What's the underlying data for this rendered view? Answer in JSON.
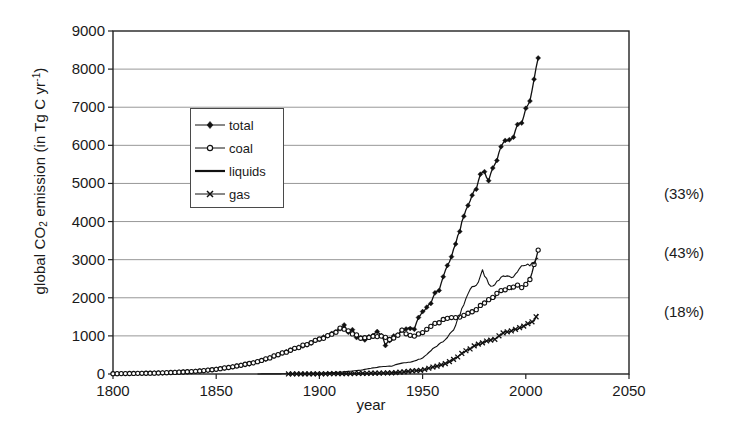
{
  "chart_data": {
    "type": "line",
    "title": "",
    "xlabel": "year",
    "ylabel": "global CO2 emission (in Tg C yr-1)",
    "ylabel_parts": {
      "pre": "global CO",
      "sub": "2",
      "mid": " emission (in Tg C yr",
      "sup": "-1",
      "post": ")"
    },
    "xlim": [
      1800,
      2050
    ],
    "ylim": [
      0,
      9000
    ],
    "xticks": [
      1800,
      1850,
      1900,
      1950,
      2000,
      2050
    ],
    "yticks": [
      0,
      1000,
      2000,
      3000,
      4000,
      5000,
      6000,
      7000,
      8000,
      9000
    ],
    "grid": "horizontal",
    "legend_position": "upper-left-inside",
    "annotations": [
      {
        "text": "(33%)",
        "value": 4500,
        "series": "coal",
        "top_px": 186
      },
      {
        "text": "(43%)",
        "value": 2900,
        "series": "liquids",
        "top_px": 245
      },
      {
        "text": "(18%)",
        "value": 1400,
        "series": "gas",
        "top_px": 304
      }
    ],
    "series": [
      {
        "name": "total",
        "marker": "filled-diamond",
        "x": [
          1800,
          1805,
          1810,
          1815,
          1820,
          1825,
          1830,
          1835,
          1840,
          1845,
          1850,
          1855,
          1860,
          1865,
          1870,
          1875,
          1880,
          1885,
          1890,
          1895,
          1900,
          1902,
          1904,
          1906,
          1908,
          1910,
          1912,
          1914,
          1916,
          1918,
          1920,
          1922,
          1924,
          1926,
          1928,
          1930,
          1932,
          1934,
          1936,
          1938,
          1940,
          1942,
          1944,
          1946,
          1948,
          1950,
          1952,
          1954,
          1956,
          1958,
          1960,
          1962,
          1964,
          1966,
          1968,
          1970,
          1972,
          1974,
          1976,
          1978,
          1980,
          1982,
          1984,
          1986,
          1988,
          1990,
          1992,
          1994,
          1996,
          1998,
          2000,
          2002,
          2004,
          2006
        ],
        "values": [
          8,
          12,
          15,
          18,
          23,
          30,
          43,
          56,
          70,
          88,
          124,
          160,
          207,
          255,
          320,
          405,
          505,
          600,
          700,
          790,
          920,
          960,
          1020,
          1080,
          1120,
          1180,
          1270,
          1100,
          1180,
          960,
          940,
          880,
          980,
          1020,
          1100,
          1020,
          760,
          880,
          1000,
          1010,
          1150,
          1180,
          1200,
          1170,
          1490,
          1630,
          1760,
          1860,
          2110,
          2230,
          2570,
          2800,
          3070,
          3430,
          3790,
          4090,
          4440,
          4710,
          4900,
          5190,
          5310,
          5100,
          5390,
          5630,
          5990,
          6130,
          6110,
          6240,
          6590,
          6610,
          6930,
          7180,
          7750,
          8290
        ]
      },
      {
        "name": "coal",
        "marker": "open-circle",
        "x": [
          1800,
          1810,
          1820,
          1830,
          1840,
          1850,
          1860,
          1870,
          1880,
          1890,
          1900,
          1905,
          1910,
          1915,
          1920,
          1925,
          1930,
          1935,
          1940,
          1945,
          1950,
          1955,
          1960,
          1965,
          1970,
          1975,
          1980,
          1985,
          1990,
          1995,
          2000,
          2002,
          2004,
          2006
        ],
        "values": [
          8,
          15,
          23,
          43,
          70,
          124,
          207,
          320,
          505,
          700,
          920,
          1010,
          1180,
          1110,
          940,
          960,
          1010,
          880,
          1130,
          970,
          1070,
          1310,
          1410,
          1480,
          1530,
          1660,
          1860,
          2030,
          2240,
          2280,
          2340,
          2490,
          2870,
          3250
        ]
      },
      {
        "name": "liquids",
        "marker": "none",
        "x": [
          1870,
          1880,
          1890,
          1900,
          1910,
          1920,
          1925,
          1930,
          1935,
          1940,
          1945,
          1950,
          1955,
          1960,
          1965,
          1970,
          1973,
          1976,
          1979,
          1980,
          1982,
          1983,
          1985,
          1988,
          1990,
          1993,
          1996,
          1999,
          2002,
          2004,
          2006
        ],
        "values": [
          1,
          3,
          9,
          19,
          47,
          100,
          150,
          190,
          210,
          290,
          320,
          420,
          660,
          850,
          1150,
          1830,
          2240,
          2330,
          2700,
          2580,
          2360,
          2280,
          2360,
          2550,
          2570,
          2530,
          2700,
          2840,
          2860,
          2940,
          2990
        ]
      },
      {
        "name": "gas",
        "marker": "x",
        "x": [
          1885,
          1890,
          1895,
          1900,
          1910,
          1920,
          1930,
          1935,
          1940,
          1945,
          1950,
          1955,
          1960,
          1965,
          1970,
          1975,
          1980,
          1985,
          1990,
          1995,
          2000,
          2003,
          2006
        ],
        "values": [
          1,
          2,
          3,
          5,
          9,
          15,
          26,
          30,
          50,
          80,
          100,
          180,
          250,
          380,
          570,
          730,
          830,
          930,
          1090,
          1170,
          1280,
          1360,
          1550
        ]
      }
    ]
  },
  "legend": {
    "items": [
      {
        "label": "total",
        "marker": "filled-diamond"
      },
      {
        "label": "coal",
        "marker": "open-circle"
      },
      {
        "label": "liquids",
        "marker": "none"
      },
      {
        "label": "gas",
        "marker": "x"
      }
    ]
  },
  "axis_labels": {
    "x": "year",
    "yticks": [
      "0",
      "1000",
      "2000",
      "3000",
      "4000",
      "5000",
      "6000",
      "7000",
      "8000",
      "9000"
    ],
    "xticks": [
      "1800",
      "1850",
      "1900",
      "1950",
      "2000",
      "2050"
    ]
  },
  "colors": {
    "line": "#111111",
    "grid": "#8c8c8c",
    "axis": "#222222",
    "background": "#ffffff"
  }
}
